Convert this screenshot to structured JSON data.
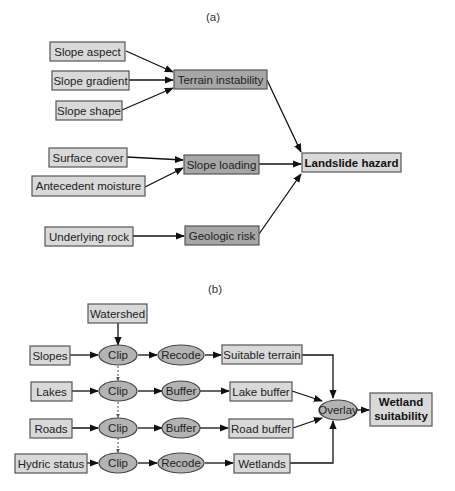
{
  "panel_a": {
    "label": "(a)",
    "inputs": [
      "Slope aspect",
      "Slope gradient",
      "Slope shape",
      "Surface cover",
      "Antecedent moisture",
      "Underlying rock"
    ],
    "intermediates": [
      "Terrain instability",
      "Slope loading",
      "Geologic risk"
    ],
    "output": "Landslide hazard",
    "edges": [
      [
        "Slope aspect",
        "Terrain instability"
      ],
      [
        "Slope gradient",
        "Terrain instability"
      ],
      [
        "Slope shape",
        "Terrain instability"
      ],
      [
        "Surface cover",
        "Slope loading"
      ],
      [
        "Antecedent moisture",
        "Slope loading"
      ],
      [
        "Underlying rock",
        "Geologic risk"
      ],
      [
        "Terrain instability",
        "Landslide hazard"
      ],
      [
        "Slope loading",
        "Landslide hazard"
      ],
      [
        "Geologic risk",
        "Landslide hazard"
      ]
    ]
  },
  "panel_b": {
    "label": "(b)",
    "watershed": "Watershed",
    "rows": [
      {
        "input": "Slopes",
        "op1": "Clip",
        "op2": "Recode",
        "result": "Suitable terrain"
      },
      {
        "input": "Lakes",
        "op1": "Clip",
        "op2": "Buffer",
        "result": "Lake buffer"
      },
      {
        "input": "Roads",
        "op1": "Clip",
        "op2": "Buffer",
        "result": "Road buffer"
      },
      {
        "input": "Hydric status",
        "op1": "Clip",
        "op2": "Recode",
        "result": "Wetlands"
      }
    ],
    "combine_op": "Overlay",
    "output_line1": "Wetland",
    "output_line2": "suitability"
  }
}
